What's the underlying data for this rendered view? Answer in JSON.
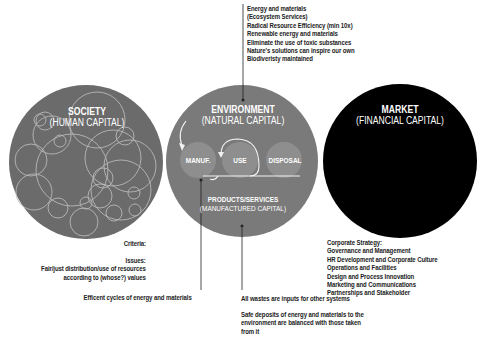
{
  "colors": {
    "society_fill": "#6b6b6b",
    "environment_fill": "#7a7a7a",
    "market_fill": "#000000",
    "inner_circle_fill": "#8e8e8e",
    "line": "#222222",
    "text": "#222222"
  },
  "society": {
    "title": "SOCIETY",
    "subtitle": "(HUMAN CAPITAL)",
    "criteria_label": "Criteria:",
    "issues_label": "Issues:",
    "issues_lines": [
      "Fair/just distribution/use of resources",
      "according to (whose?) values"
    ]
  },
  "environment": {
    "title": "ENVIRONMENT",
    "subtitle": "(NATURAL CAPITAL)",
    "stages": [
      "MANUF.",
      "USE",
      "DISPOSAL"
    ],
    "products_title": "PRODUCTS/SERVICES",
    "products_subtitle": "(MANUFACTURED CAPITAL)",
    "top_notes": [
      "Energy and materials",
      "(Ecosystem Services)",
      "Radical Resource Efficiency (min 10x)",
      "Renewable energy and materials",
      "Eliminate the use of toxic substances",
      "Nature's solutions can inspire our own",
      "Biodiveristy maintained"
    ],
    "manuf_note": "Efficent cycles of energy and materials",
    "waste_note": "All wastes are inputs for other systems",
    "deposit_note_lines": [
      "Safe deposits of energy and materials to the",
      "environment are balanced with those taken",
      "from it"
    ]
  },
  "market": {
    "title": "MARKET",
    "subtitle": "(FINANCIAL CAPITAL)",
    "strategy_lines": [
      "Corporate Strategy:",
      "Governance and Management",
      "HR Development and Corporate Culture",
      "Operations and Facilities",
      "Design and Process Innovation",
      "Marketing and Communications",
      "Partnerships and Stakeholder"
    ]
  }
}
